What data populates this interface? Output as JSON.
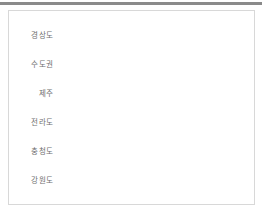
{
  "chart_data": {
    "type": "bar",
    "orientation": "horizontal",
    "title": "",
    "subtitle": "",
    "xlabel": "",
    "ylabel": "",
    "grid": false,
    "legend": false,
    "categories": [
      "경상도",
      "수도권",
      "제주",
      "전라도",
      "충청도",
      "강원도"
    ],
    "values": [
      100,
      79,
      75,
      53,
      50,
      39
    ],
    "xlim": [
      0,
      100
    ],
    "bar_color": "#c9c9c9",
    "label_color": "#6f6f6f",
    "series": [
      {
        "name": "",
        "values": [
          100,
          79,
          75,
          53,
          50,
          39
        ]
      }
    ],
    "bars": [
      {
        "label": "경상도",
        "value": 100
      },
      {
        "label": "수도권",
        "value": 79
      },
      {
        "label": "제주",
        "value": 75
      },
      {
        "label": "전라도",
        "value": 53
      },
      {
        "label": "충청도",
        "value": 50
      },
      {
        "label": "강원도",
        "value": 39
      }
    ]
  },
  "frame": {
    "border_color": "#d8d8d8",
    "background": "#ffffff",
    "rule_color": "#8a8a8a"
  }
}
